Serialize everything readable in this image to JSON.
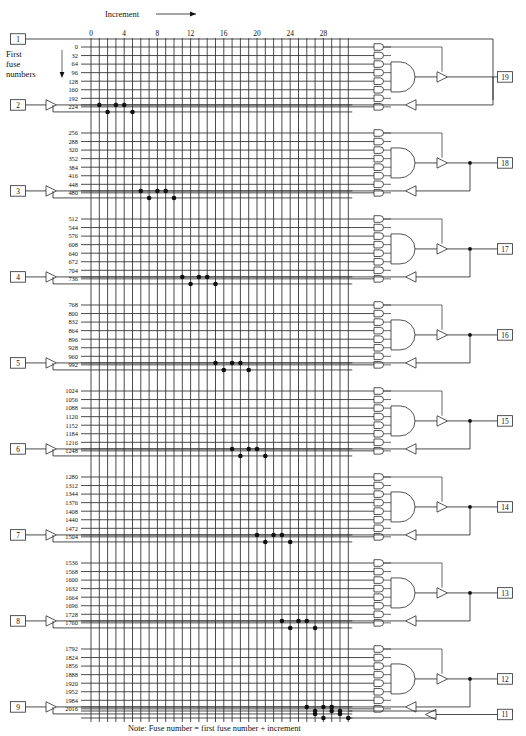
{
  "diagram": {
    "title_label": "Increment",
    "first_fuse_label_lines": [
      "First",
      "fuse",
      "numbers"
    ],
    "note": "Note:  Fuse number = first fuse number + increment",
    "column_ticks": [
      "0",
      "4",
      "8",
      "12",
      "16",
      "20",
      "24",
      "28"
    ],
    "column_count": 32,
    "input_pins": [
      "1",
      "2",
      "3",
      "4",
      "5",
      "6",
      "7",
      "8",
      "9"
    ],
    "output_pins": [
      "19",
      "18",
      "17",
      "16",
      "15",
      "14",
      "13",
      "12",
      "11"
    ],
    "colors": {
      "line": "#2a2a2a",
      "background": "#ffffff",
      "text": "#111111"
    },
    "blocks": [
      {
        "output_pin": "19",
        "input_pin": "2",
        "fuse_numbers": [
          "0",
          "32",
          "64",
          "96",
          "128",
          "160",
          "192",
          "224"
        ],
        "fuse_dots_upper": [
          1,
          3,
          4
        ],
        "fuse_dots_lower": [
          2,
          5
        ]
      },
      {
        "output_pin": "18",
        "input_pin": "3",
        "fuse_numbers": [
          "256",
          "288",
          "320",
          "352",
          "384",
          "416",
          "448",
          "480"
        ],
        "fuse_dots_upper": [
          6,
          8,
          9
        ],
        "fuse_dots_lower": [
          7,
          10
        ]
      },
      {
        "output_pin": "17",
        "input_pin": "4",
        "fuse_numbers": [
          "512",
          "544",
          "576",
          "608",
          "640",
          "672",
          "704",
          "736"
        ],
        "fuse_dots_upper": [
          11,
          13,
          14
        ],
        "fuse_dots_lower": [
          12,
          15
        ]
      },
      {
        "output_pin": "16",
        "input_pin": "5",
        "fuse_numbers": [
          "768",
          "800",
          "832",
          "864",
          "896",
          "928",
          "960",
          "992"
        ],
        "fuse_dots_upper": [
          15,
          17,
          18
        ],
        "fuse_dots_lower": [
          16,
          19
        ]
      },
      {
        "output_pin": "15",
        "input_pin": "6",
        "fuse_numbers": [
          "1024",
          "1056",
          "1088",
          "1120",
          "1152",
          "1184",
          "1216",
          "1248"
        ],
        "fuse_dots_upper": [
          17,
          19,
          20
        ],
        "fuse_dots_lower": [
          18,
          21
        ]
      },
      {
        "output_pin": "14",
        "input_pin": "7",
        "fuse_numbers": [
          "1280",
          "1312",
          "1344",
          "1376",
          "1408",
          "1440",
          "1472",
          "1504"
        ],
        "fuse_dots_upper": [
          20,
          22,
          23
        ],
        "fuse_dots_lower": [
          21,
          24
        ]
      },
      {
        "output_pin": "13",
        "input_pin": "8",
        "fuse_numbers": [
          "1536",
          "1568",
          "1600",
          "1632",
          "1664",
          "1696",
          "1728",
          "1760"
        ],
        "fuse_dots_upper": [
          23,
          25,
          26
        ],
        "fuse_dots_lower": [
          24,
          27
        ]
      },
      {
        "output_pin": "12",
        "input_pin": "9",
        "fuse_numbers": [
          "1792",
          "1824",
          "1856",
          "1888",
          "1920",
          "1952",
          "1984",
          "2016"
        ],
        "fuse_dots_upper": [
          26,
          28,
          29
        ],
        "fuse_dots_lower": [
          27,
          30
        ]
      }
    ],
    "bottom_row": {
      "output_pin": "11",
      "fuse_dots_upper": [
        27,
        29,
        30
      ],
      "fuse_dots_lower": [
        28,
        31
      ]
    }
  }
}
